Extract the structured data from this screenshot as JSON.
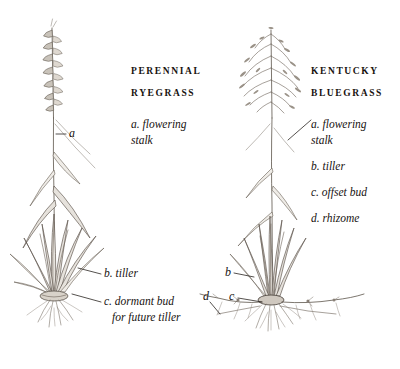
{
  "plate": {
    "title": "Perennial Ryegrass and Kentucky Bluegrass growth habit comparison",
    "background_color": "#ffffff",
    "ink_color": "#3a332c"
  },
  "figures": [
    {
      "id": "perennial-ryegrass",
      "heading_line1": "PERENNIAL",
      "heading_line2": "RYEGRASS",
      "inflorescence_type": "spike",
      "growth_habit": "bunch-type",
      "legend": [
        {
          "key": "a",
          "text": "a. flowering",
          "text2": "stalk"
        },
        {
          "key": "b",
          "text": "b. tiller"
        },
        {
          "key": "c",
          "text": "c. dormant bud",
          "text2": "for future tiller"
        }
      ],
      "callouts": [
        {
          "key": "a",
          "label": "a"
        },
        {
          "key": "b",
          "label": "b. tiller"
        },
        {
          "key": "c",
          "label": "c. dormant bud"
        },
        {
          "key": "c2",
          "label": "for future tiller"
        }
      ]
    },
    {
      "id": "kentucky-bluegrass",
      "heading_line1": "KENTUCKY",
      "heading_line2": "BLUEGRASS",
      "inflorescence_type": "panicle",
      "growth_habit": "rhizomatous",
      "legend": [
        {
          "key": "a",
          "text": "a. flowering",
          "text2": "stalk"
        },
        {
          "key": "b",
          "text": "b. tiller"
        },
        {
          "key": "c",
          "text": "c. offset bud"
        },
        {
          "key": "d",
          "text": "d. rhizome"
        }
      ],
      "callouts": [
        {
          "key": "b",
          "label": "b"
        },
        {
          "key": "c",
          "label": "c"
        },
        {
          "key": "d",
          "label": "d"
        }
      ]
    }
  ]
}
